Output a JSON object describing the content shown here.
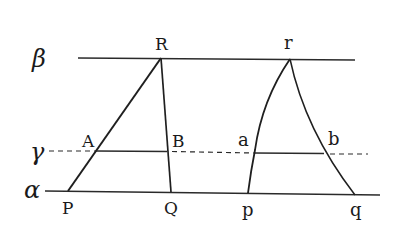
{
  "diagram": {
    "planes": {
      "beta": {
        "label": "β",
        "style": "solid"
      },
      "gamma": {
        "label": "γ",
        "style": "dashed"
      },
      "alpha": {
        "label": "α",
        "style": "solid"
      }
    },
    "left_triangle": {
      "apex": "R",
      "base_left": "P",
      "base_right": "Q",
      "section_left": "A",
      "section_right": "B",
      "edges": "straight"
    },
    "right_triangle": {
      "apex": "r",
      "base_left": "p",
      "base_right": "q",
      "section_left": "a",
      "section_right": "b",
      "edges": "curved"
    },
    "colors": {
      "line": "#2a2a2a",
      "background": "#ffffff"
    }
  }
}
